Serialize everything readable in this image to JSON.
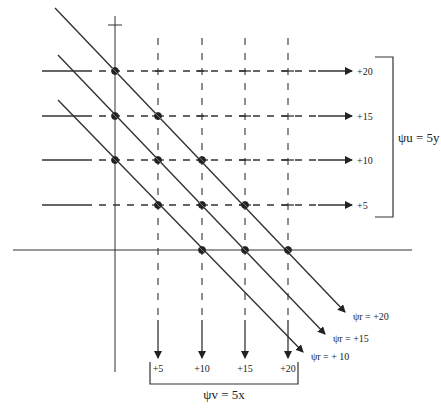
{
  "diagram": {
    "axes": {
      "x_axis": {
        "y": 250,
        "x1": 13,
        "x2": 412
      },
      "y_axis": {
        "x": 115,
        "y1": 16,
        "y2": 372,
        "tick_y": 25
      }
    },
    "horizontal_lines": {
      "bracket_label": "ψu = 5y",
      "lines": [
        {
          "value": 20,
          "label": "+20",
          "y": 71
        },
        {
          "value": 15,
          "label": "+15",
          "y": 116
        },
        {
          "value": 10,
          "label": "+10",
          "y": 160
        },
        {
          "value": 5,
          "label": "+5",
          "y": 205
        }
      ]
    },
    "vertical_lines": {
      "bracket_label": "ψv = 5x",
      "lines": [
        {
          "value": 5,
          "label": "+5",
          "x": 158
        },
        {
          "value": 10,
          "label": "+10",
          "x": 202
        },
        {
          "value": 15,
          "label": "+15",
          "x": 245
        },
        {
          "value": 20,
          "label": "+20",
          "x": 288
        }
      ]
    },
    "resultant_lines": [
      {
        "value": 20,
        "label": "ψr = +20",
        "start": [
          55,
          8
        ],
        "end": [
          345,
          312
        ]
      },
      {
        "value": 15,
        "label": "ψr = +15",
        "start": [
          58,
          55
        ],
        "end": [
          325,
          334
        ]
      },
      {
        "value": 10,
        "label": "ψr = + 10",
        "start": [
          58,
          100
        ],
        "end": [
          303,
          352
        ]
      }
    ],
    "intersections": [
      [
        115,
        71
      ],
      [
        158,
        116
      ],
      [
        202,
        160
      ],
      [
        245,
        205
      ],
      [
        288,
        250
      ],
      [
        115,
        116
      ],
      [
        158,
        160
      ],
      [
        202,
        205
      ],
      [
        245,
        250
      ],
      [
        115,
        160
      ],
      [
        158,
        205
      ],
      [
        202,
        250
      ]
    ],
    "caption": "Figure (caption cut off)"
  }
}
